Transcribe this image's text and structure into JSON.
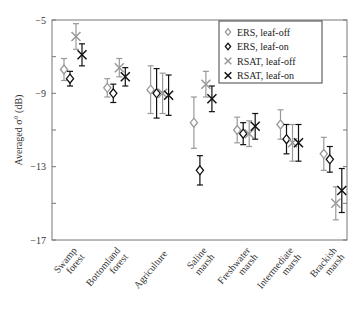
{
  "chart_data": {
    "type": "scatter",
    "title": "",
    "xlabel": "",
    "ylabel": "Averaged σ° (dB)",
    "ylim": [
      -17,
      -5
    ],
    "yticks": [
      -5,
      -9,
      -13,
      -17
    ],
    "grid": false,
    "legend_position": "upper right (inside)",
    "categories": [
      "Swamp forest",
      "Bottomland forest",
      "Agriculture",
      "Saline marsh",
      "Freshwater marsh",
      "Intermediate marsh",
      "Brackish marsh"
    ],
    "category_lines": [
      [
        "Swamp",
        "forest"
      ],
      [
        "Bottomland",
        "forest"
      ],
      [
        "Agriculture"
      ],
      [
        "Saline",
        "marsh"
      ],
      [
        "Freshwater",
        "marsh"
      ],
      [
        "Intermediate",
        "marsh"
      ],
      [
        "Brackish",
        "marsh"
      ]
    ],
    "series": [
      {
        "name": "ERS, leaf-off",
        "marker": "diamond",
        "color": "#999999",
        "values": [
          -7.7,
          -8.7,
          -8.8,
          -10.6,
          -11.0,
          -10.7,
          -12.3
        ],
        "error": [
          0.6,
          0.5,
          1.3,
          1.4,
          0.7,
          0.8,
          0.9
        ]
      },
      {
        "name": "ERS, leaf-on",
        "marker": "diamond",
        "color": "#111111",
        "values": [
          -8.2,
          -9.0,
          -9.0,
          -13.2,
          -11.2,
          -11.5,
          -12.6
        ],
        "error": [
          0.4,
          0.5,
          1.35,
          0.8,
          0.6,
          0.8,
          0.7
        ]
      },
      {
        "name": "RSAT, leaf-off",
        "marker": "x",
        "color": "#999999",
        "values": [
          -5.9,
          -7.6,
          -9.0,
          -8.5,
          -11.2,
          -11.7,
          -15.0
        ],
        "error": [
          0.7,
          0.5,
          1.1,
          0.7,
          0.7,
          1.0,
          0.9
        ]
      },
      {
        "name": "RSAT, leaf-on",
        "marker": "x",
        "color": "#111111",
        "values": [
          -6.9,
          -8.1,
          -9.1,
          -9.3,
          -10.8,
          -11.7,
          -14.3
        ],
        "error": [
          0.6,
          0.5,
          1.1,
          0.7,
          0.7,
          1.0,
          1.2
        ]
      }
    ]
  }
}
